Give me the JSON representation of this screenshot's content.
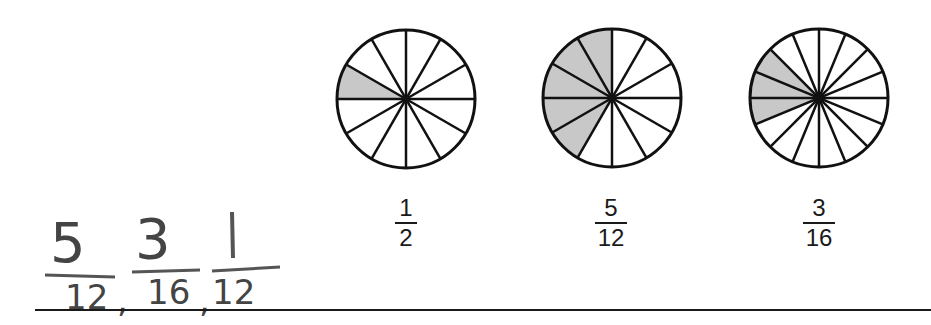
{
  "problem": {
    "type": "compare-fractions-worksheet",
    "colors": {
      "shade": "#c8c8c8",
      "stroke": "#111111",
      "handwriting": "#555555"
    }
  },
  "circles": [
    {
      "sectors": 12,
      "shaded": 1,
      "label": {
        "numerator": "1",
        "denominator": "2"
      }
    },
    {
      "sectors": 12,
      "shaded": 5,
      "label": {
        "numerator": "5",
        "denominator": "12"
      }
    },
    {
      "sectors": 16,
      "shaded": 3,
      "label": {
        "numerator": "3",
        "denominator": "16"
      }
    }
  ],
  "answer": {
    "fractions": [
      {
        "numerator": "5",
        "denominator": "12"
      },
      {
        "numerator": "3",
        "denominator": "16"
      },
      {
        "numerator": "1",
        "denominator": "12"
      }
    ],
    "separator": ","
  }
}
